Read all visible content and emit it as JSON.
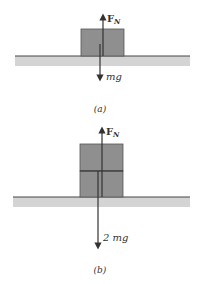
{
  "colors": {
    "block": "#8f8f8f",
    "block_edge": "#555555",
    "ground": "#d4d4d4",
    "ground_line": "#444444",
    "arrow": "#333333"
  },
  "panel_a": {
    "normal_force": {
      "label": "F",
      "subscript": "N"
    },
    "weight": {
      "label": "mg"
    },
    "caption": "(a)"
  },
  "panel_b": {
    "normal_force": {
      "label": "F",
      "subscript": "N"
    },
    "weight": {
      "label": "2 mg"
    },
    "caption": "(b)"
  }
}
